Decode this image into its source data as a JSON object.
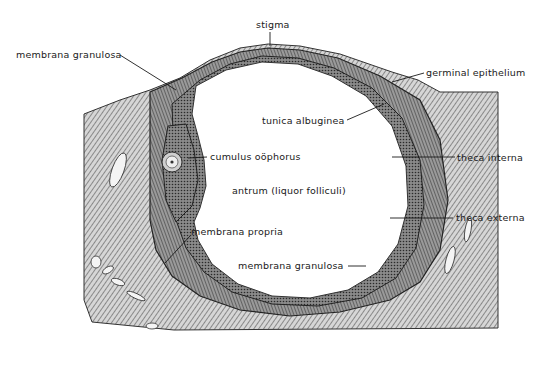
{
  "figure": {
    "labels": {
      "stigma": "stigma",
      "membrana_granulosa_top": "membrana granulosa",
      "germinal_epithelium": "germinal epithelium",
      "tunica_albuginea": "tunica albuginea",
      "cumulus_oophorus": "cumulus oöphorus",
      "theca_interna": "theca interna",
      "antrum": "antrum (liquor folliculi)",
      "theca_externa": "theca externa",
      "membrana_propria": "membrana propria",
      "membrana_granulosa_bottom": "membrana granulosa"
    }
  },
  "colors": {
    "ink": "#1a1a1a",
    "tissue_dark": "#3a3a3a",
    "tissue_mid": "#7a7a7a",
    "tissue_light": "#bdbdbd",
    "background": "#ffffff"
  }
}
